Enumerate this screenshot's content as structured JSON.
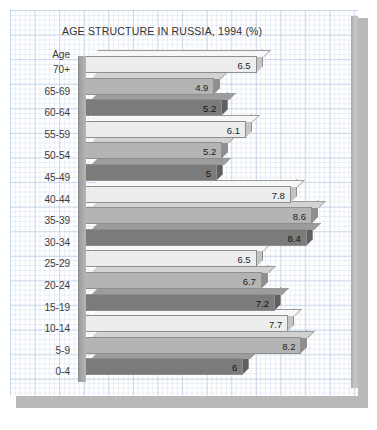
{
  "chart_data": {
    "type": "bar",
    "orientation": "horizontal",
    "title": "AGE STRUCTURE IN RUSSIA, 1994 (%)",
    "xlabel": "",
    "ylabel": "Age",
    "axis_header": "Age",
    "categories": [
      "70+",
      "65-69",
      "60-64",
      "55-59",
      "50-54",
      "45-49",
      "40-44",
      "35-39",
      "30-34",
      "25-29",
      "20-24",
      "15-19",
      "10-14",
      "5-9",
      "0-4"
    ],
    "values": [
      6.5,
      4.9,
      5.2,
      6.1,
      5.2,
      5,
      7.8,
      8.6,
      8.4,
      6.5,
      6.7,
      7.2,
      7.7,
      8.2,
      6
    ],
    "value_labels": [
      "6.5",
      "4.9",
      "5.2",
      "6.1",
      "5.2",
      "5",
      "7.8",
      "8.6",
      "8.4",
      "6.5",
      "6.7",
      "7.2",
      "7.7",
      "8.2",
      "6"
    ],
    "xlim": [
      0,
      9
    ],
    "grid": true,
    "legend": "none",
    "series_colors": [
      "#ededed",
      "#b4b4b4",
      "#7b7b7b"
    ],
    "background": "graph-paper"
  }
}
